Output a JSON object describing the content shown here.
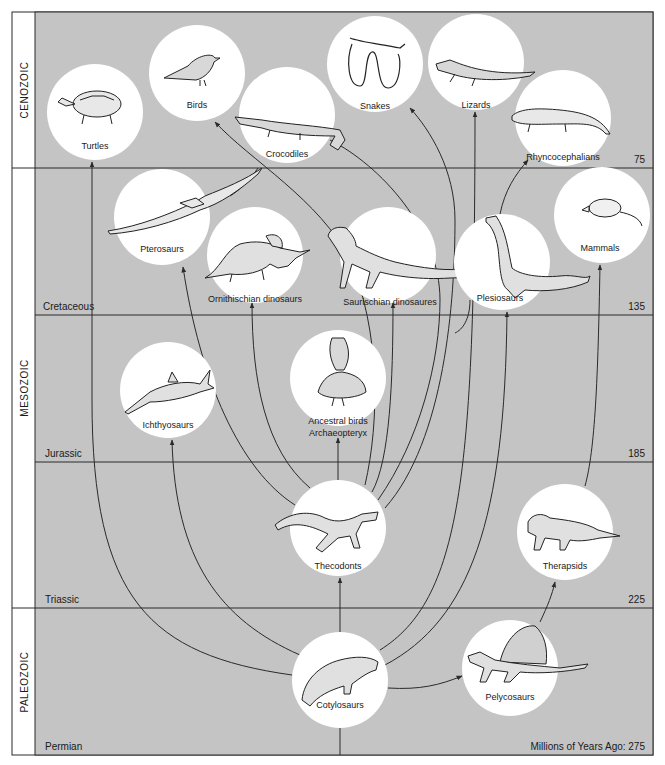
{
  "colors": {
    "background": "#c4c4c4",
    "sidebar": "#ffffff",
    "line": "#2a2a2a",
    "circle": "#ffffff",
    "text": "#1a1a1a"
  },
  "eras": [
    {
      "label": "CENOZOIC",
      "y1": 12,
      "y2": 168
    },
    {
      "label": "MESOZOIC",
      "y1": 168,
      "y2": 608
    },
    {
      "label": "PALEOZOIC",
      "y1": 608,
      "y2": 755
    }
  ],
  "periods": [
    {
      "label": "Cretaceous",
      "boundary_y": 315
    },
    {
      "label": "Jurassic",
      "boundary_y": 462
    },
    {
      "label": "Triassic",
      "boundary_y": 608
    },
    {
      "label": "Permian",
      "boundary_y": 755
    }
  ],
  "time_markers": [
    {
      "label": "75",
      "y": 168
    },
    {
      "label": "135",
      "y": 315
    },
    {
      "label": "185",
      "y": 462
    },
    {
      "label": "225",
      "y": 608
    },
    {
      "label": "Millions of Years Ago: 275",
      "y": 755
    }
  ],
  "groups": [
    {
      "id": "turtles",
      "label": "Turtles",
      "cx": 95,
      "cy": 112,
      "r": 48,
      "icon": "turtle-icon"
    },
    {
      "id": "birds",
      "label": "Birds",
      "cx": 197,
      "cy": 73,
      "r": 48,
      "icon": "bird-icon"
    },
    {
      "id": "crocodiles",
      "label": "Crocodiles",
      "cx": 287,
      "cy": 115,
      "r": 48,
      "icon": "crocodile-icon"
    },
    {
      "id": "snakes",
      "label": "Snakes",
      "cx": 375,
      "cy": 64,
      "r": 48,
      "icon": "snake-icon"
    },
    {
      "id": "lizards",
      "label": "Lizards",
      "cx": 476,
      "cy": 62,
      "r": 48,
      "icon": "lizard-icon"
    },
    {
      "id": "rhyncocephalians",
      "label": "Rhyncocephalians",
      "cx": 563,
      "cy": 118,
      "r": 48,
      "icon": "tuatara-icon"
    },
    {
      "id": "pterosaurs",
      "label": "Pterosaurs",
      "cx": 162,
      "cy": 217,
      "r": 48,
      "icon": "pterosaur-icon"
    },
    {
      "id": "ornithischian",
      "label": "Ornithischian dinosaurs",
      "cx": 255,
      "cy": 255,
      "r": 48,
      "icon": "triceratops-icon"
    },
    {
      "id": "saurischian",
      "label": "Saurischian dinosaures",
      "cx": 388,
      "cy": 255,
      "r": 48,
      "icon": "tyrannosaur-icon"
    },
    {
      "id": "plesiosaurs",
      "label": "Plesiosaurs",
      "cx": 502,
      "cy": 262,
      "r": 48,
      "icon": "plesiosaur-icon"
    },
    {
      "id": "mammals",
      "label": "Mammals",
      "cx": 602,
      "cy": 215,
      "r": 48,
      "icon": "opossum-icon"
    },
    {
      "id": "ichthyosaurs",
      "label": "Ichthyosaurs",
      "cx": 168,
      "cy": 390,
      "r": 48,
      "icon": "ichthyosaur-icon"
    },
    {
      "id": "archaeopteryx",
      "label": "Ancestral birds",
      "label2": "Archaeopteryx",
      "cx": 338,
      "cy": 378,
      "r": 48,
      "icon": "archaeopteryx-icon"
    },
    {
      "id": "thecodonts",
      "label": "Thecodonts",
      "cx": 338,
      "cy": 528,
      "r": 48,
      "icon": "thecodont-icon"
    },
    {
      "id": "therapsids",
      "label": "Therapsids",
      "cx": 565,
      "cy": 532,
      "r": 48,
      "icon": "therapsid-icon"
    },
    {
      "id": "pelycosaurs",
      "label": "Pelycosaurs",
      "cx": 510,
      "cy": 668,
      "r": 48,
      "icon": "dimetrodon-icon"
    },
    {
      "id": "cotylosaurs",
      "label": "Cotylosaurs",
      "cx": 340,
      "cy": 680,
      "r": 48,
      "icon": "cotylosaur-icon"
    }
  ],
  "links": [
    {
      "from": "cotylosaurs",
      "to": "turtles"
    },
    {
      "from": "cotylosaurs",
      "to": "ichthyosaurs"
    },
    {
      "from": "cotylosaurs",
      "to": "thecodonts"
    },
    {
      "from": "cotylosaurs",
      "to": "plesiosaurs"
    },
    {
      "from": "cotylosaurs",
      "to": "pelycosaurs"
    },
    {
      "from": "cotylosaurs",
      "to": "lizards"
    },
    {
      "from": "pelycosaurs",
      "to": "therapsids"
    },
    {
      "from": "therapsids",
      "to": "mammals"
    },
    {
      "from": "thecodonts",
      "to": "pterosaurs"
    },
    {
      "from": "thecodonts",
      "to": "ornithischian"
    },
    {
      "from": "thecodonts",
      "to": "archaeopteryx"
    },
    {
      "from": "thecodonts",
      "to": "saurischian"
    },
    {
      "from": "thecodonts",
      "to": "crocodiles"
    },
    {
      "from": "thecodonts",
      "to": "birds"
    },
    {
      "from": "thecodonts",
      "to": "snakes"
    },
    {
      "from": "plesiosaurs",
      "to": "rhyncocephalians"
    }
  ]
}
